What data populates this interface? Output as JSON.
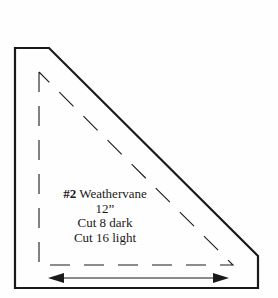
{
  "template": {
    "number": "#2",
    "name": "Weathervane",
    "size": "12”",
    "cut_dark": "Cut 8 dark",
    "cut_light": "Cut 16 light"
  },
  "colors": {
    "ink": "#1a1a1a",
    "background": "#fefefe"
  }
}
